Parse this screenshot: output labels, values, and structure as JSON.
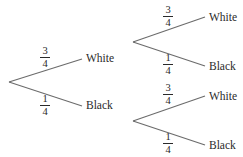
{
  "diagram": {
    "type": "probability-tree",
    "first_stage": {
      "upper": {
        "probability": {
          "num": "3",
          "den": "4"
        },
        "outcome": "White"
      },
      "lower": {
        "probability": {
          "num": "1",
          "den": "4"
        },
        "outcome": "Black"
      }
    },
    "second_stage_top": {
      "upper": {
        "probability": {
          "num": "3",
          "den": "4"
        },
        "outcome": "White"
      },
      "lower": {
        "probability": {
          "num": "1",
          "den": "4"
        },
        "outcome": "Black"
      }
    },
    "second_stage_bottom": {
      "upper": {
        "probability": {
          "num": "3",
          "den": "4"
        },
        "outcome": "White"
      },
      "lower": {
        "probability": {
          "num": "1",
          "den": "4"
        },
        "outcome": "Black"
      }
    },
    "line_color": "#6b6b6b",
    "text_color": "#2a2a2a"
  }
}
